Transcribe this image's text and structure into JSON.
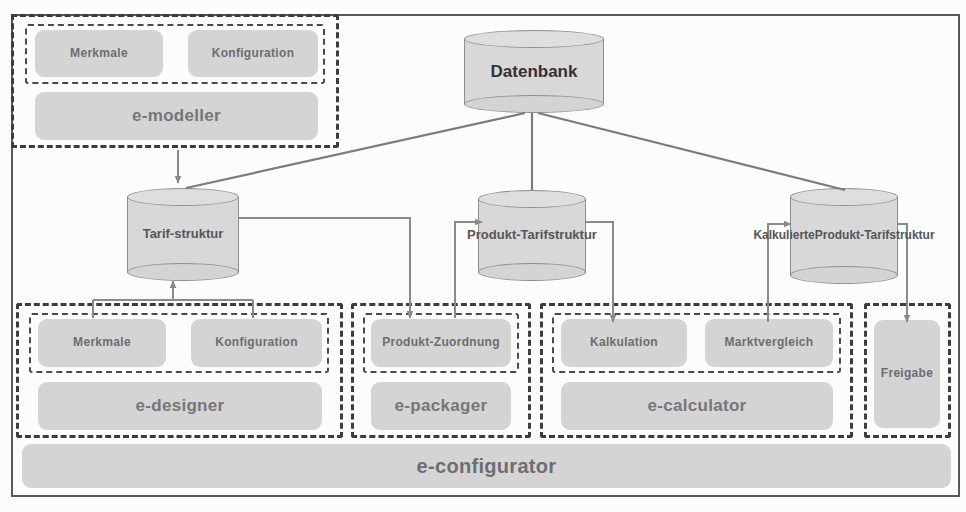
{
  "diagram": {
    "colors": {
      "box_fill": "#d4d4d4",
      "cylinder_fill": "#d8d8d8",
      "dash_border": "#3c3c3e",
      "frame_border": "#58585a",
      "wire": "#8a8a8c"
    }
  },
  "database": {
    "label": "Datenbank"
  },
  "stores": [
    {
      "id": "tarifstruktur",
      "label": "Tarif-\nstruktur",
      "lines": [
        "Tarif-",
        "struktur"
      ]
    },
    {
      "id": "produkt-tarifstruktur",
      "label": "Produkt-\nTarifstruktur",
      "lines": [
        "Produkt-",
        "Tarifstruktur"
      ]
    },
    {
      "id": "kalkulierte-produkt-tarifstruktur",
      "label": "Kalkulierte\nProdukt-\nTarifstruktur",
      "lines": [
        "Kalkulierte",
        "Produkt-",
        "Tarifstruktur"
      ]
    }
  ],
  "modeller_group": {
    "module_label": "e-modeller",
    "features": [
      {
        "label": "Merkmale"
      },
      {
        "label": "Konfiguration"
      }
    ]
  },
  "designer_group": {
    "module_label": "e-designer",
    "features": [
      {
        "label": "Merkmale"
      },
      {
        "label": "Konfiguration"
      }
    ]
  },
  "packager_group": {
    "module_label": "e-packager",
    "features": [
      {
        "label": "Produkt-\nZuordnung",
        "lines": [
          "Produkt-",
          "Zuordnung"
        ]
      }
    ]
  },
  "calculator_group": {
    "module_label": "e-calculator",
    "features": [
      {
        "label": "Kalkulation"
      },
      {
        "label": "Marktvergleich"
      }
    ]
  },
  "release_group": {
    "features": [
      {
        "label": "Freigabe"
      }
    ]
  },
  "configurator": {
    "label": "e-configurator"
  }
}
